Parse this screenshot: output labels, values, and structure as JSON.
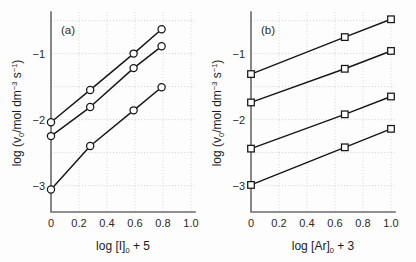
{
  "figure": {
    "background_color": "#fdfdfd",
    "axis_color": "#6b6b6b",
    "grid_color": "#c9c9c9",
    "line_color": "#161616",
    "marker_fill": "#ffffff"
  },
  "panel_a": {
    "label": "(a)",
    "xlabel_parts": {
      "main": "log [I]",
      "sub": "0",
      "tail": " + 5"
    },
    "ylabel_parts": {
      "p1": "log (v",
      "sub1": "0",
      "p2": "/mol dm",
      "sup1": "−3",
      "p3": " s",
      "sup2": "−1",
      "p4": ")"
    },
    "xticks": [
      "0",
      "0.2",
      "0.4",
      "0.6",
      "0.8",
      "1.0"
    ],
    "yticks": [
      "−1",
      "−2",
      "−3"
    ]
  },
  "panel_b": {
    "label": "(b)",
    "xlabel_parts": {
      "main": "log [Ar]",
      "sub": "0",
      "tail": " + 3"
    },
    "ylabel_parts": {
      "p1": "log (v",
      "sub1": "0",
      "p2": "/mol dm",
      "sup1": "−3",
      "p3": " s",
      "sup2": "−1",
      "p4": ")"
    },
    "xticks": [
      "0",
      "0.2",
      "0.4",
      "0.6",
      "0.8",
      "1.0"
    ],
    "yticks": [
      "−1",
      "−2",
      "−3"
    ]
  },
  "chart_data": [
    {
      "type": "scatter",
      "title": "(a)",
      "xlabel": "log [I]0 + 5",
      "ylabel": "log (v0/mol dm-3 s-1)",
      "xlim": [
        0.0,
        1.0
      ],
      "ylim": [
        -3.4,
        -0.4
      ],
      "xticks": [
        0.0,
        0.2,
        0.4,
        0.6,
        0.8,
        1.0
      ],
      "yticks": [
        -1,
        -2,
        -3
      ],
      "grid": true,
      "legend": "none",
      "marker": "open-circle",
      "series": [
        {
          "name": "upper",
          "x": [
            0.0,
            0.28,
            0.59,
            0.79
          ],
          "y": [
            -2.04,
            -1.55,
            -1.0,
            -0.63
          ]
        },
        {
          "name": "middle",
          "x": [
            0.0,
            0.28,
            0.59,
            0.79
          ],
          "y": [
            -2.25,
            -1.81,
            -1.22,
            -0.89
          ]
        },
        {
          "name": "lower",
          "x": [
            0.0,
            0.28,
            0.59,
            0.79
          ],
          "y": [
            -3.06,
            -2.4,
            -1.86,
            -1.51
          ]
        }
      ]
    },
    {
      "type": "scatter",
      "title": "(b)",
      "xlabel": "log [Ar]0 + 3",
      "ylabel": "log (v0/mol dm-3 s-1)",
      "xlim": [
        0.0,
        1.0
      ],
      "ylim": [
        -3.4,
        -0.4
      ],
      "xticks": [
        0.0,
        0.2,
        0.4,
        0.6,
        0.8,
        1.0
      ],
      "yticks": [
        -1,
        -2,
        -3
      ],
      "grid": true,
      "legend": "none",
      "marker": "open-square",
      "series": [
        {
          "name": "top",
          "x": [
            0.0,
            0.67,
            1.0
          ],
          "y": [
            -1.31,
            -0.75,
            -0.48
          ]
        },
        {
          "name": "second",
          "x": [
            0.0,
            0.67,
            1.0
          ],
          "y": [
            -1.74,
            -1.23,
            -0.96
          ]
        },
        {
          "name": "third",
          "x": [
            0.0,
            0.67,
            1.0
          ],
          "y": [
            -2.44,
            -1.92,
            -1.65
          ]
        },
        {
          "name": "bottom",
          "x": [
            0.0,
            0.67,
            1.0
          ],
          "y": [
            -2.99,
            -2.42,
            -2.14
          ]
        }
      ]
    }
  ]
}
